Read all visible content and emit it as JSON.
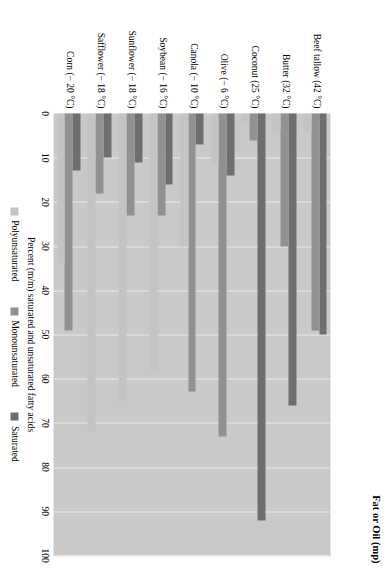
{
  "chart_data": {
    "type": "bar",
    "orientation": "horizontal",
    "title": "",
    "xlabel": "Percent (m/m) saturated and unsaturated fatty acids",
    "ylabel": "Fat or Oil (mp)",
    "xlim": [
      0,
      100
    ],
    "xticks": [
      0,
      10,
      20,
      30,
      40,
      50,
      60,
      70,
      80,
      90,
      100
    ],
    "grid": true,
    "legend_position": "bottom",
    "categories": [
      "Beef tallow (42 °C)",
      "Butter (32 °C)",
      "Coconut (25 °C)",
      "Olive (− 6 °C)",
      "Canola (− 10 °C)",
      "Soybean (− 16 °C)",
      "Sunflower (− 18 °C)",
      "Safflower (− 18 °C)",
      "Corn (− 20 °C)"
    ],
    "series": [
      {
        "name": "Saturated",
        "color": "#6e6e6e",
        "values": [
          50,
          66,
          92,
          14,
          7,
          16,
          11,
          10,
          13
        ]
      },
      {
        "name": "Monounsaturated",
        "color": "#919191",
        "values": [
          49,
          30,
          6,
          73,
          63,
          23,
          23,
          18,
          49
        ]
      },
      {
        "name": "Polyunsaturated",
        "color": "#c4c4c4",
        "values": [
          4,
          4,
          2,
          11,
          30,
          58,
          65,
          72,
          34
        ]
      }
    ],
    "legend": [
      "Polyunsaturated",
      "Monounsaturated",
      "Saturated"
    ],
    "colors": {
      "plot_background": "#c9c9c9",
      "gridline": "#e9e9e9",
      "saturated": "#6e6e6e",
      "monounsaturated": "#919191",
      "polyunsaturated": "#c4c4c4"
    }
  }
}
